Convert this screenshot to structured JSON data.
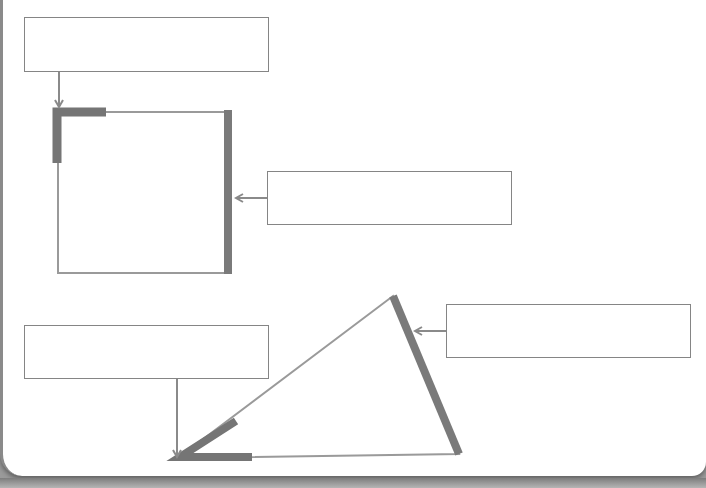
{
  "worksheet": {
    "colors": {
      "line": "#8f8f8f",
      "highlight": "#757575",
      "box_border": "#858585",
      "background": "#ffffff"
    },
    "label_boxes": [
      {
        "id": "box-1",
        "value": "",
        "points_to": "square-corner"
      },
      {
        "id": "box-2",
        "value": "",
        "points_to": "square-side"
      },
      {
        "id": "box-3",
        "value": "",
        "points_to": "triangle-angle"
      },
      {
        "id": "box-4",
        "value": "",
        "points_to": "triangle-side"
      }
    ],
    "shapes": [
      {
        "name": "square",
        "highlighted": [
          "corner (top-left angle)",
          "side (right)"
        ]
      },
      {
        "name": "triangle",
        "highlighted": [
          "angle (bottom-left vertex)",
          "side (right)"
        ]
      }
    ]
  }
}
